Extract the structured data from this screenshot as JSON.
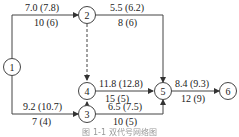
{
  "diagram": {
    "type": "activity-network",
    "nodes": [
      {
        "id": "1",
        "label": "1"
      },
      {
        "id": "2",
        "label": "2"
      },
      {
        "id": "3",
        "label": "3"
      },
      {
        "id": "4",
        "label": "4"
      },
      {
        "id": "5",
        "label": "5"
      },
      {
        "id": "6",
        "label": "6"
      }
    ],
    "edges": [
      {
        "from": "1",
        "to": "2",
        "top": "7.0 (7.8)",
        "bottom": "10 (6)",
        "style": "solid"
      },
      {
        "from": "2",
        "to": "5",
        "top": "5.5 (6.2)",
        "bottom": "8 (6)",
        "style": "solid"
      },
      {
        "from": "1",
        "to": "3",
        "top": "9.2 (10.7)",
        "bottom": "7 (4)",
        "style": "solid"
      },
      {
        "from": "3",
        "to": "5",
        "top": "6.5 (7.5)",
        "bottom": "10 (5)",
        "style": "solid"
      },
      {
        "from": "4",
        "to": "5",
        "top": "11.8 (12.8)",
        "bottom": "15 (5)",
        "style": "solid"
      },
      {
        "from": "5",
        "to": "6",
        "top": "8.4 (9.3)",
        "bottom": "12 (9)",
        "style": "solid"
      },
      {
        "from": "2",
        "to": "4",
        "top": "",
        "bottom": "",
        "style": "dashed"
      },
      {
        "from": "3",
        "to": "4",
        "top": "",
        "bottom": "",
        "style": "dashed"
      }
    ],
    "caption": "图 1-1 双代号网络图"
  }
}
